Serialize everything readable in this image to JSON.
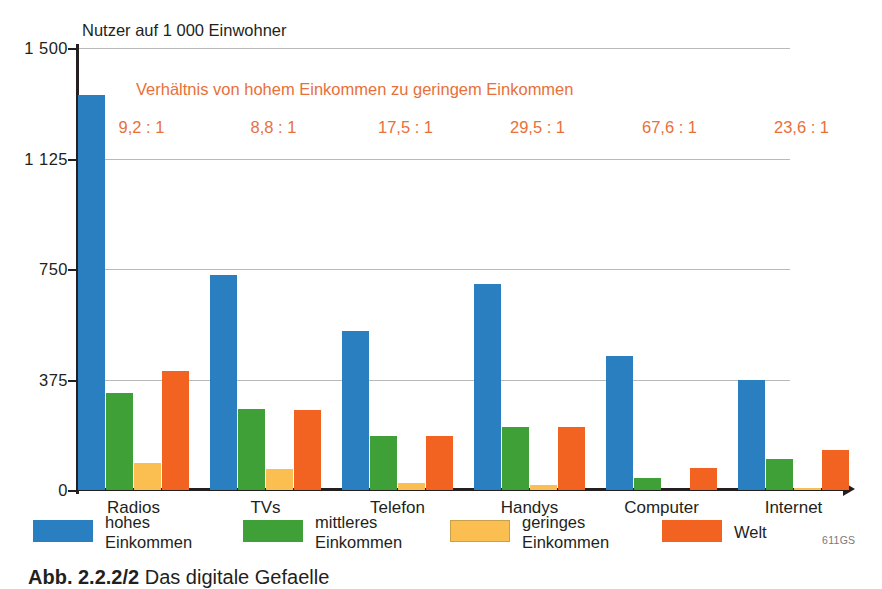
{
  "chart_data": {
    "type": "bar",
    "title": "",
    "ylabel": "Nutzer auf 1 000 Einwohner",
    "xlabel": "",
    "ylim": [
      0,
      1500
    ],
    "yticks": [
      0,
      375,
      750,
      1125,
      1500
    ],
    "ytick_labels": [
      "0",
      "375",
      "750",
      "1 125",
      "1 500"
    ],
    "grid": true,
    "legend_position": "bottom",
    "categories": [
      "Radios",
      "TVs",
      "Telefon",
      "Handys",
      "Computer",
      "Internet"
    ],
    "series": [
      {
        "name": "hohes Einkommen",
        "color": "#2a7fc1",
        "values": [
          1340,
          730,
          540,
          700,
          455,
          375
        ]
      },
      {
        "name": "mittleres Einkommen",
        "color": "#3fa037",
        "values": [
          330,
          275,
          185,
          215,
          40,
          105
        ]
      },
      {
        "name": "geringes Einkommen",
        "color": "#fbbe50",
        "values": [
          90,
          70,
          25,
          18,
          0,
          8
        ]
      },
      {
        "name": "Welt",
        "color": "#f26322",
        "values": [
          405,
          270,
          185,
          215,
          75,
          135
        ]
      }
    ],
    "annotation_header": "Verhältnis von hohem Einkommen zu geringem Einkommen",
    "annotations": [
      "9,2 : 1",
      "8,8 : 1",
      "17,5 : 1",
      "29,5 : 1",
      "67,6 : 1",
      "23,6 : 1"
    ]
  },
  "legend": {
    "items": [
      {
        "label_line1": "hohes",
        "label_line2": "Einkommen",
        "color": "#2a7fc1"
      },
      {
        "label_line1": "mittleres",
        "label_line2": "Einkommen",
        "color": "#3fa037"
      },
      {
        "label_line1": "geringes",
        "label_line2": "Einkommen",
        "color": "#fbbe50"
      },
      {
        "label_line1": "Welt",
        "label_line2": "",
        "color": "#f26322"
      }
    ],
    "code": "611GS"
  },
  "caption": {
    "figure_number": "Abb. 2.2.2/2",
    "text": "Das digitale Gefaelle"
  },
  "colors": {
    "high_income": "#2a7fc1",
    "middle_income": "#3fa037",
    "low_income": "#fbbe50",
    "world": "#f26322",
    "annotation": "#e8703a",
    "axis": "#231f20",
    "grid": "#b9b9b9"
  }
}
